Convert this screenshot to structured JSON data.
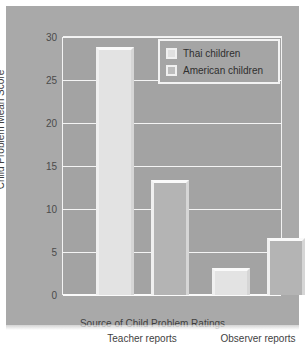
{
  "chart_data": {
    "type": "bar",
    "title": "",
    "xlabel": "Source of Child Problem Ratings",
    "ylabel": "Child Problem Mean Score",
    "categories": [
      "Teacher reports",
      "Observer reports"
    ],
    "series": [
      {
        "name": "Thai children",
        "values": [
          28.8,
          3.1
        ],
        "color": "#e3e3e3"
      },
      {
        "name": "American children",
        "values": [
          13.4,
          6.6
        ],
        "color": "#b4b4b4"
      }
    ],
    "ylim": [
      0,
      30
    ],
    "yticks": [
      0,
      5,
      10,
      15,
      20,
      25,
      30
    ],
    "ytick_labels": [
      "0",
      "5",
      "10",
      "15",
      "20",
      "25",
      "30"
    ],
    "grid": true,
    "legend_position": "upper right",
    "panel_color": "#a9a9a9",
    "gridline_color": "#f4f4f4"
  },
  "legend": {
    "entries": [
      {
        "label": "Thai children"
      },
      {
        "label": "American children"
      }
    ]
  }
}
